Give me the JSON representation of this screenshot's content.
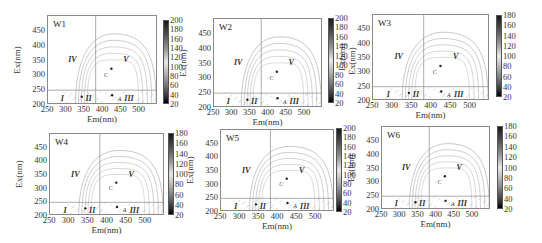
{
  "chart_data": [
    {
      "type": "heatmap",
      "subtype": "EEM fluorescence contour",
      "title": "W1",
      "xlabel": "Em(nm)",
      "ylabel": "Ex(nm)",
      "xticks": [
        250,
        300,
        350,
        400,
        450,
        500
      ],
      "yticks": [
        200,
        250,
        300,
        350,
        400,
        450
      ],
      "xlim": [
        250,
        550
      ],
      "ylim": [
        200,
        500
      ],
      "divider_x": 380,
      "divider_y": 250,
      "regions": [
        "I",
        "II",
        "III",
        "IV",
        "V"
      ],
      "peaks": [
        "A",
        "C"
      ],
      "colorbar": {
        "min": 20,
        "max": 200,
        "ticks": [
          20,
          40,
          60,
          80,
          100,
          120,
          140,
          160,
          180,
          200
        ]
      }
    },
    {
      "type": "heatmap",
      "subtype": "EEM fluorescence contour",
      "title": "W2",
      "xlabel": "Em(nm)",
      "ylabel": "Ex(nm)",
      "xticks": [
        250,
        300,
        350,
        400,
        450,
        500
      ],
      "yticks": [
        200,
        250,
        300,
        350,
        400,
        450
      ],
      "xlim": [
        250,
        550
      ],
      "ylim": [
        200,
        500
      ],
      "divider_x": 380,
      "divider_y": 250,
      "regions": [
        "I",
        "II",
        "III",
        "IV",
        "V"
      ],
      "peaks": [
        "A",
        "C"
      ],
      "colorbar": {
        "min": 20,
        "max": 200,
        "ticks": [
          20,
          40,
          60,
          80,
          100,
          120,
          140,
          160,
          180,
          200
        ],
        "label": "Ex(nm)"
      }
    },
    {
      "type": "heatmap",
      "subtype": "EEM fluorescence contour",
      "title": "W3",
      "xlabel": "Em(nm)",
      "ylabel": "Ex(nm)",
      "xticks": [
        250,
        300,
        350,
        400,
        450,
        500
      ],
      "yticks": [
        200,
        250,
        300,
        350,
        400,
        450
      ],
      "xlim": [
        250,
        550
      ],
      "ylim": [
        200,
        500
      ],
      "divider_x": 380,
      "divider_y": 250,
      "regions": [
        "I",
        "II",
        "III",
        "IV",
        "V"
      ],
      "peaks": [
        "A",
        "C"
      ],
      "colorbar": {
        "min": 20,
        "max": 180,
        "ticks": [
          20,
          40,
          60,
          80,
          100,
          120,
          140,
          160,
          180
        ]
      }
    },
    {
      "type": "heatmap",
      "subtype": "EEM fluorescence contour",
      "title": "W4",
      "xlabel": "Em(nm)",
      "ylabel": "Ex(nm)",
      "xticks": [
        250,
        300,
        350,
        400,
        450,
        500
      ],
      "yticks": [
        200,
        250,
        300,
        350,
        400,
        450
      ],
      "xlim": [
        250,
        550
      ],
      "ylim": [
        200,
        500
      ],
      "divider_x": 380,
      "divider_y": 250,
      "regions": [
        "I",
        "II",
        "III",
        "IV",
        "V"
      ],
      "peaks": [
        "A",
        "C"
      ],
      "colorbar": {
        "min": 20,
        "max": 180,
        "ticks": [
          20,
          40,
          60,
          80,
          100,
          120,
          140,
          160,
          180
        ]
      }
    },
    {
      "type": "heatmap",
      "subtype": "EEM fluorescence contour",
      "title": "W5",
      "xlabel": "Em(nm)",
      "ylabel": "Ex(nm)",
      "xticks": [
        250,
        300,
        350,
        400,
        450,
        500
      ],
      "yticks": [
        200,
        250,
        300,
        350,
        400,
        450
      ],
      "xlim": [
        250,
        550
      ],
      "ylim": [
        200,
        500
      ],
      "divider_x": 380,
      "divider_y": 250,
      "regions": [
        "I",
        "II",
        "III",
        "IV",
        "V"
      ],
      "peaks": [
        "A",
        "C"
      ],
      "colorbar": {
        "min": 20,
        "max": 200,
        "ticks": [
          20,
          40,
          60,
          80,
          100,
          120,
          140,
          160,
          180,
          200
        ]
      }
    },
    {
      "type": "heatmap",
      "subtype": "EEM fluorescence contour",
      "title": "W6",
      "xlabel": "Em(nm)",
      "ylabel": "Ex(nm)",
      "xticks": [
        250,
        300,
        350,
        400,
        450,
        500
      ],
      "yticks": [
        200,
        250,
        300,
        350,
        400,
        450
      ],
      "xlim": [
        250,
        550
      ],
      "ylim": [
        200,
        500
      ],
      "divider_x": 380,
      "divider_y": 250,
      "regions": [
        "I",
        "II",
        "III",
        "IV",
        "V"
      ],
      "peaks": [
        "A",
        "C"
      ],
      "colorbar": {
        "min": 20,
        "max": 180,
        "ticks": [
          20,
          40,
          60,
          80,
          100,
          120,
          140,
          160,
          180
        ]
      }
    }
  ],
  "panels": [
    {
      "title": "W1",
      "xlabel": "Em(nm)",
      "ylabel": "Ex(nm)",
      "cbar_label": "",
      "yt": [
        "450",
        "400",
        "350",
        "300",
        "250",
        "200"
      ],
      "xt": [
        "250",
        "300",
        "350",
        "400",
        "450",
        "500"
      ],
      "ct": [
        "200",
        "180",
        "160",
        "140",
        "120",
        "100",
        "80",
        "60",
        "40",
        "20"
      ],
      "r": {
        "i": "I",
        "ii": "II",
        "iii": "III",
        "iv": "IV",
        "v": "V",
        "a": "A",
        "c": "C"
      }
    },
    {
      "title": "W2",
      "xlabel": "Em(nm)",
      "ylabel": "Ex(nm)",
      "cbar_label": "Ex(nm)",
      "yt": [
        "450",
        "400",
        "350",
        "300",
        "250",
        "200"
      ],
      "xt": [
        "250",
        "300",
        "350",
        "400",
        "450",
        "500"
      ],
      "ct": [
        "200",
        "180",
        "160",
        "140",
        "120",
        "100",
        "80",
        "60",
        "40",
        "20"
      ],
      "r": {
        "i": "I",
        "ii": "II",
        "iii": "III",
        "iv": "IV",
        "v": "V",
        "a": "A",
        "c": "C"
      }
    },
    {
      "title": "W3",
      "xlabel": "Em(nm)",
      "ylabel": "Ex(nm)",
      "cbar_label": "",
      "yt": [
        "450",
        "400",
        "350",
        "300",
        "250",
        "200"
      ],
      "xt": [
        "250",
        "300",
        "350",
        "400",
        "450",
        "500"
      ],
      "ct": [
        "180",
        "160",
        "140",
        "120",
        "100",
        "80",
        "60",
        "40",
        "20"
      ],
      "r": {
        "i": "I",
        "ii": "II",
        "iii": "III",
        "iv": "IV",
        "v": "V",
        "a": "A",
        "c": "C"
      }
    },
    {
      "title": "W4",
      "xlabel": "Em(nm)",
      "ylabel": "Ex(nm)",
      "cbar_label": "",
      "yt": [
        "450",
        "400",
        "350",
        "300",
        "250",
        "200"
      ],
      "xt": [
        "250",
        "300",
        "350",
        "400",
        "450",
        "500"
      ],
      "ct": [
        "180",
        "160",
        "140",
        "120",
        "100",
        "80",
        "60",
        "40",
        "20"
      ],
      "r": {
        "i": "I",
        "ii": "II",
        "iii": "III",
        "iv": "IV",
        "v": "V",
        "a": "A",
        "c": "C"
      }
    },
    {
      "title": "W5",
      "xlabel": "Em(nm)",
      "ylabel": "Ex(nm)",
      "cbar_label": "",
      "yt": [
        "450",
        "400",
        "350",
        "300",
        "250",
        "200"
      ],
      "xt": [
        "250",
        "300",
        "350",
        "400",
        "450",
        "500"
      ],
      "ct": [
        "200",
        "180",
        "160",
        "140",
        "120",
        "100",
        "80",
        "60",
        "40",
        "20"
      ],
      "r": {
        "i": "I",
        "ii": "II",
        "iii": "III",
        "iv": "IV",
        "v": "V",
        "a": "A",
        "c": "C"
      }
    },
    {
      "title": "W6",
      "xlabel": "Em(nm)",
      "ylabel": "Ex(nm)",
      "cbar_label": "",
      "yt": [
        "450",
        "400",
        "350",
        "300",
        "250",
        "200"
      ],
      "xt": [
        "250",
        "300",
        "350",
        "400",
        "450",
        "500"
      ],
      "ct": [
        "180",
        "160",
        "140",
        "120",
        "100",
        "80",
        "60",
        "40",
        "20"
      ],
      "r": {
        "i": "I",
        "ii": "II",
        "iii": "III",
        "iv": "IV",
        "v": "V",
        "a": "A",
        "c": "C"
      }
    }
  ],
  "layout": [
    {
      "fx": 47,
      "fy": 15,
      "fw": 110,
      "fh": 89,
      "cx": 163,
      "cy": 20,
      "ch": 84
    },
    {
      "fx": 213,
      "fy": 18,
      "fw": 109,
      "fh": 89,
      "cx": 328,
      "cy": 18,
      "ch": 85
    },
    {
      "fx": 372,
      "fy": 14,
      "fw": 117,
      "fh": 86,
      "cx": 496,
      "cy": 15,
      "ch": 82
    },
    {
      "fx": 49,
      "fy": 133,
      "fw": 115,
      "fh": 82,
      "cx": 168,
      "cy": 133,
      "ch": 82
    },
    {
      "fx": 220,
      "fy": 129,
      "fw": 114,
      "fh": 82,
      "cx": 336,
      "cy": 128,
      "ch": 84
    },
    {
      "fx": 381,
      "fy": 126,
      "fw": 109,
      "fh": 83,
      "cx": 497,
      "cy": 126,
      "ch": 83
    }
  ]
}
